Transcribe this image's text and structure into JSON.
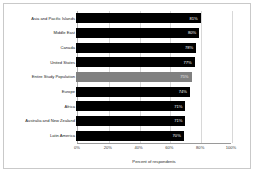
{
  "chart_data": {
    "type": "bar",
    "orientation": "horizontal",
    "title": "",
    "xlabel": "Percent of respondents",
    "ylabel": "",
    "xlim": [
      0,
      100
    ],
    "xticks": [
      "0%",
      "20%",
      "40%",
      "60%",
      "80%",
      "100%"
    ],
    "xtick_values": [
      0,
      20,
      40,
      60,
      80,
      100
    ],
    "grid": true,
    "legend": "none",
    "categories": [
      "Asia and Pacific Islands",
      "Middle East",
      "Canada",
      "United States",
      "Entire Study Population",
      "Europe",
      "Africa",
      "Australia and New Zealand",
      "Latin America"
    ],
    "values": [
      81,
      80,
      78,
      77,
      75,
      74,
      71,
      71,
      70
    ],
    "value_labels": [
      "81%",
      "80%",
      "78%",
      "77%",
      "75%",
      "74%",
      "71%",
      "71%",
      "70%"
    ],
    "highlight_index": 4,
    "colors": {
      "bar": "#000000",
      "highlight_bar": "#808080",
      "value_text": "#ffffff",
      "grid": "#d8d8d8",
      "axis": "#9a9a9a",
      "frame": "#c9c9c9",
      "background": "#ffffff"
    }
  }
}
